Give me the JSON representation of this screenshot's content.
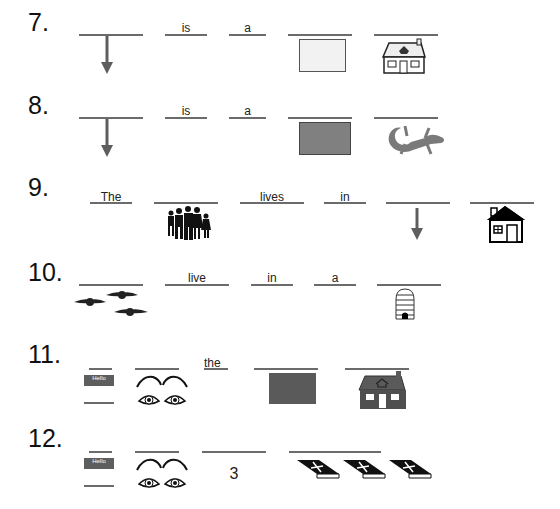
{
  "worksheet": {
    "rows": [
      {
        "number": "7.",
        "words": [
          "is",
          "a"
        ]
      },
      {
        "number": "8.",
        "words": [
          "is",
          "a"
        ]
      },
      {
        "number": "9.",
        "words": [
          "The",
          "lives",
          "in"
        ]
      },
      {
        "number": "10.",
        "words": [
          "live",
          "in",
          "a"
        ]
      },
      {
        "number": "11.",
        "words": [
          "the"
        ]
      },
      {
        "number": "12.",
        "words": [
          "3"
        ]
      }
    ],
    "name_tag_text": "Hello"
  },
  "colors": {
    "line": "#6b6b6b",
    "light_box": "#f2f2f2",
    "medium_box": "#808080",
    "dark_box": "#5a5a5a",
    "lizard": "#7a7a7a"
  }
}
